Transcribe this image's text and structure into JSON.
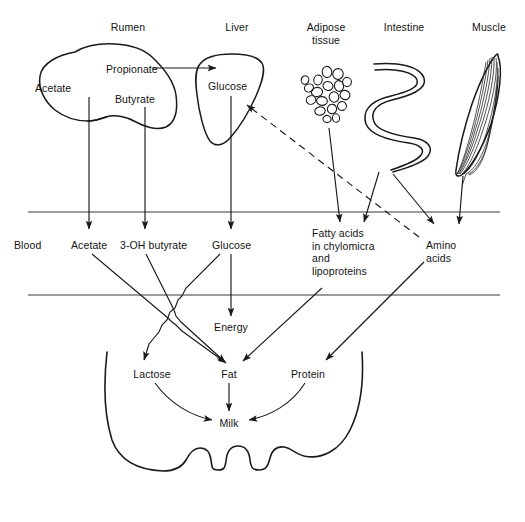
{
  "figure": {
    "background_color": "#ffffff",
    "line_color": "#1a1a1a",
    "text_color": "#141414"
  },
  "organs": [
    {
      "id": "rumen",
      "label": "Rumen",
      "icon": "rumen-organ-shape",
      "label_x": 128,
      "label_y": 27
    },
    {
      "id": "liver",
      "label": "Liver",
      "icon": "liver-organ-shape",
      "label_x": 237,
      "label_y": 27
    },
    {
      "id": "adipose",
      "label": "Adipose\ntissue",
      "icon": "adipose-tissue-shape",
      "label_x": 326,
      "label_y": 27
    },
    {
      "id": "intestine",
      "label": "Intestine",
      "icon": "intestine-shape",
      "label_x": 404,
      "label_y": 27
    },
    {
      "id": "muscle",
      "label": "Muscle",
      "icon": "muscle-shape",
      "label_x": 489,
      "label_y": 27
    }
  ],
  "organ_metabolites": [
    {
      "id": "propionate",
      "label": "Propionate",
      "organ": "rumen",
      "x": 106,
      "y": 69
    },
    {
      "id": "acetate_rumen",
      "label": "Acetate",
      "organ": "rumen",
      "x": 35,
      "y": 88
    },
    {
      "id": "butyrate",
      "label": "Butyrate",
      "organ": "rumen",
      "x": 115,
      "y": 99
    },
    {
      "id": "glucose_liver",
      "label": "Glucose",
      "organ": "liver",
      "x": 208,
      "y": 86
    }
  ],
  "blood_compartment": {
    "label": "Blood",
    "label_x": 14,
    "label_y": 245,
    "top_rule_y": 212,
    "bottom_rule_y": 295,
    "rule_x_start": 28,
    "rule_x_end": 500,
    "metabolites": [
      {
        "id": "acetate_blood",
        "label": "Acetate",
        "x": 71,
        "y": 245
      },
      {
        "id": "hydroxybutyrate",
        "label": "3-OH butyrate",
        "x": 120,
        "y": 245
      },
      {
        "id": "glucose_blood",
        "label": "Glucose",
        "x": 212,
        "y": 245
      },
      {
        "id": "fatty_acids",
        "label": "Fatty acids\nin chylomicra\nand\nlipoproteins",
        "x": 312,
        "y": 233
      },
      {
        "id": "amino_acids",
        "label": "Amino\nacids",
        "x": 426,
        "y": 245
      }
    ]
  },
  "udder": {
    "label": "udder-outline",
    "products": [
      {
        "id": "lactose",
        "label": "Lactose",
        "x": 152,
        "y": 374
      },
      {
        "id": "fat",
        "label": "Fat",
        "x": 229,
        "y": 374
      },
      {
        "id": "protein",
        "label": "Protein",
        "x": 308,
        "y": 374
      },
      {
        "id": "milk",
        "label": "Milk",
        "x": 229,
        "y": 423
      }
    ],
    "energy": {
      "id": "energy",
      "label": "Energy",
      "x": 229,
      "y": 327
    }
  },
  "flows": [
    {
      "id": "propionate-to-glucose",
      "from": "propionate",
      "to": "glucose_liver",
      "style": "solid"
    },
    {
      "id": "acetate-to-blood",
      "from": "acetate_rumen",
      "to": "acetate_blood",
      "style": "solid"
    },
    {
      "id": "butyrate-to-3oh-butyrate",
      "from": "butyrate",
      "to": "hydroxybutyrate",
      "style": "solid"
    },
    {
      "id": "liver-glucose-to-blood-glucose",
      "from": "glucose_liver",
      "to": "glucose_blood",
      "style": "solid"
    },
    {
      "id": "adipose-to-fatty-acids",
      "from": "adipose",
      "to": "fatty_acids",
      "style": "solid"
    },
    {
      "id": "intestine-to-fatty-acids",
      "from": "intestine",
      "to": "fatty_acids",
      "style": "solid"
    },
    {
      "id": "intestine-to-amino-acids",
      "from": "intestine",
      "to": "amino_acids",
      "style": "solid"
    },
    {
      "id": "muscle-to-amino-acids",
      "from": "muscle",
      "to": "amino_acids",
      "style": "solid"
    },
    {
      "id": "amino-acids-to-liver-glucose",
      "from": "amino_acids",
      "to": "glucose_liver",
      "style": "dashed"
    },
    {
      "id": "acetate-to-fat",
      "from": "acetate_blood",
      "to": "fat",
      "style": "solid"
    },
    {
      "id": "3oh-butyrate-to-fat",
      "from": "hydroxybutyrate",
      "to": "fat",
      "style": "solid"
    },
    {
      "id": "glucose-to-lactose",
      "from": "glucose_blood",
      "to": "lactose",
      "style": "solid"
    },
    {
      "id": "glucose-to-energy",
      "from": "glucose_blood",
      "to": "energy",
      "style": "solid"
    },
    {
      "id": "fatty-acids-to-fat",
      "from": "fatty_acids",
      "to": "fat",
      "style": "solid"
    },
    {
      "id": "amino-acids-to-protein",
      "from": "amino_acids",
      "to": "protein",
      "style": "solid"
    },
    {
      "id": "lactose-to-milk",
      "from": "lactose",
      "to": "milk",
      "style": "curved"
    },
    {
      "id": "fat-to-milk",
      "from": "fat",
      "to": "milk",
      "style": "solid"
    },
    {
      "id": "protein-to-milk",
      "from": "protein",
      "to": "milk",
      "style": "curved"
    }
  ]
}
